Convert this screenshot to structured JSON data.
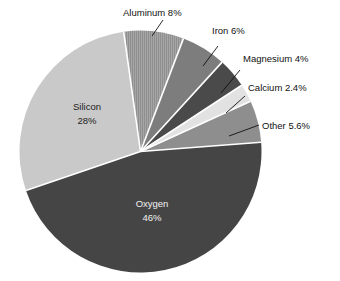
{
  "chart_data": {
    "type": "pie",
    "title": "",
    "subtitle": "",
    "xlabel": "",
    "ylabel": "",
    "legend_position": "none",
    "grid": false,
    "unit": "%",
    "categories": [
      "Aluminum",
      "Iron",
      "Magnesium",
      "Calcium",
      "Other",
      "Oxygen",
      "Silicon"
    ],
    "values": [
      8,
      6,
      4,
      2.4,
      5.6,
      46,
      28
    ],
    "labels": [
      "Aluminum 8%",
      "Iron 6%",
      "Magnesium 4%",
      "Calcium 2.4%",
      "Other 5.6%",
      "Oxygen 46%",
      "Silicon 28%"
    ],
    "slices": [
      {
        "name": "Aluminum",
        "value": 8,
        "value_text": "8%",
        "label": "Aluminum 8%",
        "color": "#9b9b9b",
        "label_placement": "callout",
        "text_color": "#111111"
      },
      {
        "name": "Iron",
        "value": 6,
        "value_text": "6%",
        "label": "Iron 6%",
        "color": "#7d7d7d",
        "label_placement": "callout",
        "text_color": "#111111"
      },
      {
        "name": "Magnesium",
        "value": 4,
        "value_text": "4%",
        "label": "Magnesium 4%",
        "color": "#4a4a4a",
        "label_placement": "callout",
        "text_color": "#111111"
      },
      {
        "name": "Calcium",
        "value": 2.4,
        "value_text": "2.4%",
        "label": "Calcium 2.4%",
        "color": "#e2e2e2",
        "label_placement": "callout",
        "text_color": "#111111"
      },
      {
        "name": "Other",
        "value": 5.6,
        "value_text": "5.6%",
        "label": "Other 5.6%",
        "color": "#8e8e8e",
        "label_placement": "callout",
        "text_color": "#111111"
      },
      {
        "name": "Oxygen",
        "value": 46,
        "value_text": "46%",
        "label": "Oxygen 46%",
        "color": "#454545",
        "label_placement": "inside",
        "text_color": "#f2f2f2"
      },
      {
        "name": "Silicon",
        "value": 28,
        "value_text": "28%",
        "label": "Silicon 28%",
        "color": "#c9c9c9",
        "label_placement": "inside",
        "text_color": "#1c1c1c"
      }
    ],
    "callouts": [
      {
        "name": "Aluminum",
        "text": "Aluminum 8%"
      },
      {
        "name": "Iron",
        "text": "Iron 6%"
      },
      {
        "name": "Magnesium",
        "text": "Magnesium 4%"
      },
      {
        "name": "Calcium",
        "text": "Calcium 2.4%"
      },
      {
        "name": "Other",
        "text": "Other 5.6%"
      }
    ],
    "inside_labels": [
      {
        "name": "Silicon",
        "line1": "Silicon",
        "line2": "28%"
      },
      {
        "name": "Oxygen",
        "line1": "Oxygen",
        "line2": "46%"
      }
    ],
    "colors": {
      "separator": "#ffffff",
      "background": "#ffffff",
      "leader_line": "#111111",
      "text": "#111111"
    }
  },
  "labels": {
    "aluminum": "Aluminum 8%",
    "iron": "Iron 6%",
    "magnesium": "Magnesium 4%",
    "calcium": "Calcium 2.4%",
    "other": "Other 5.6%",
    "silicon_name": "Silicon",
    "silicon_value": "28%",
    "oxygen_name": "Oxygen",
    "oxygen_value": "46%"
  }
}
